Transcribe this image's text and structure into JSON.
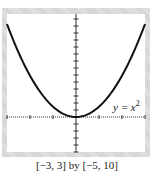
{
  "chart_data": {
    "type": "line",
    "title": "",
    "function": "y = x^2",
    "series": [
      {
        "name": "y = x^2",
        "x": [
          -3,
          -2.5,
          -2,
          -1.5,
          -1,
          -0.5,
          0,
          0.5,
          1,
          1.5,
          2,
          2.5,
          3
        ],
        "values": [
          9,
          6.25,
          4,
          2.25,
          1,
          0.25,
          0,
          0.25,
          1,
          2.25,
          4,
          6.25,
          9
        ]
      }
    ],
    "xlim": [
      -3,
      3
    ],
    "ylim": [
      -5,
      10
    ],
    "xscale_ticks": 1,
    "yscale_ticks": 1,
    "grid": false,
    "curve_label": "y = x",
    "curve_label_exp": "2",
    "window_caption": "[−3, 3] by [−5, 10]"
  }
}
